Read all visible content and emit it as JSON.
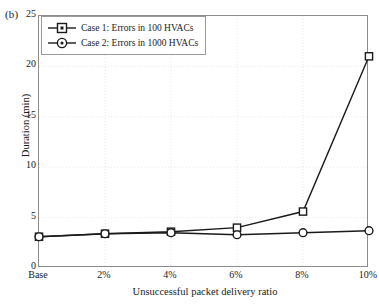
{
  "panel": {
    "label": "(b)"
  },
  "axes": {
    "ylabel": "Duration (min)",
    "xlabel": "Unsuccessful packet delivery ratio",
    "yticks": [
      "0",
      "5",
      "10",
      "15",
      "20",
      "25"
    ],
    "xticks": [
      "Base",
      "2%",
      "4%",
      "6%",
      "8%",
      "10%"
    ]
  },
  "legend": {
    "items": [
      {
        "label": "Case 1: Errors in 100 HVACs",
        "marker": "square-marker-icon",
        "color": "#1a1a1a"
      },
      {
        "label": "Case 2: Errors in 1000 HVACs",
        "marker": "circle-marker-icon",
        "color": "#1a1a1a"
      }
    ]
  },
  "colors": {
    "line": "#1a1a1a",
    "grid": "#e2e2e2",
    "axis": "#8c8c8c",
    "background": "#ffffff"
  },
  "chart_data": {
    "type": "line",
    "title": "",
    "subtitle": "",
    "xlabel": "Unsuccessful packet delivery ratio",
    "ylabel": "Duration (min)",
    "categories": [
      "Base",
      "2%",
      "4%",
      "6%",
      "8%",
      "10%"
    ],
    "xlim": [
      0,
      5
    ],
    "ylim": [
      0,
      25
    ],
    "yticks": [
      0,
      5,
      10,
      15,
      20,
      25
    ],
    "grid": true,
    "legend_position": "top-left",
    "annotations": [
      "(b)"
    ],
    "series": [
      {
        "name": "Case 1: Errors in 100 HVACs",
        "marker": "square",
        "color": "#1a1a1a",
        "values": [
          3.1,
          3.4,
          3.6,
          4.0,
          5.6,
          21.0
        ]
      },
      {
        "name": "Case 2: Errors in 1000 HVACs",
        "marker": "circle",
        "color": "#1a1a1a",
        "values": [
          3.1,
          3.4,
          3.5,
          3.3,
          3.5,
          3.7
        ]
      }
    ]
  }
}
